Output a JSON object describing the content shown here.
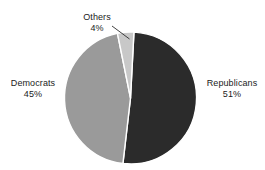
{
  "chart_data": {
    "type": "pie",
    "title": "",
    "subtitle": "",
    "xlabel": "",
    "ylabel": "",
    "legend_position": "none",
    "grid": false,
    "units": "percent",
    "start_angle_deg": 3,
    "direction": "clockwise",
    "categories": [
      "Republicans",
      "Democrats",
      "Others"
    ],
    "values": [
      51,
      45,
      4
    ],
    "slices": [
      {
        "label": "Republicans",
        "value": 51,
        "value_text": "51%",
        "color": "#2b2b2b",
        "label_position": "right-outside"
      },
      {
        "label": "Democrats",
        "value": 45,
        "value_text": "45%",
        "color": "#9a9a9a",
        "label_position": "left-outside"
      },
      {
        "label": "Others",
        "value": 4,
        "value_text": "4%",
        "color": "#c8c8c8",
        "label_position": "top-left-outside-with-leader"
      }
    ]
  },
  "figure": {
    "background_color": "#ffffff",
    "slice_separator_color": "#ffffff",
    "leader_line_color": "#2b2b2b",
    "text_color": "#1b1b1b"
  },
  "labels": {
    "others": {
      "name": "Others",
      "value": "4%"
    },
    "democrats": {
      "name": "Democrats",
      "value": "45%"
    },
    "republicans": {
      "name": "Republicans",
      "value": "51%"
    }
  }
}
